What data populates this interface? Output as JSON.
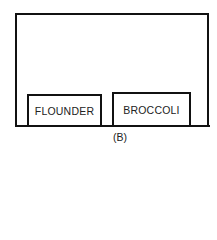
{
  "diagram": {
    "caption": "(B)",
    "container": {
      "shape": "open-top-frame"
    },
    "items": [
      {
        "label": "FLOUNDER"
      },
      {
        "label": "BROCCOLI"
      }
    ]
  }
}
